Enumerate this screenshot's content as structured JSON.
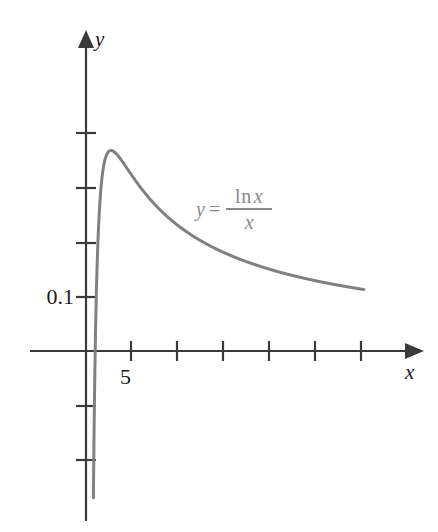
{
  "figure": {
    "title": "",
    "background_color": "#ffffff",
    "width": 438,
    "height": 532
  },
  "axes": {
    "x_axis_name": "x",
    "y_axis_name": "y",
    "axis_color": "#3a3a3a",
    "origin_px": {
      "x": 86,
      "y": 351
    },
    "x_tick_labels": [
      "5"
    ],
    "y_tick_labels": [
      "0.1"
    ]
  },
  "annotation": {
    "equation_lhs": "y",
    "equation_equals": "=",
    "equation_numerator_fn": "ln",
    "equation_numerator_var": "x",
    "equation_denominator": "x",
    "color": "#8a8a8a"
  },
  "chart_data": {
    "type": "line",
    "title": "",
    "xlabel": "x",
    "ylabel": "y",
    "series": [
      {
        "name": "y = ln x / x",
        "color": "#808080",
        "formula": "ln(x)/x",
        "x": [
          1.0,
          1.05,
          1.1,
          1.15,
          1.2,
          1.3,
          1.4,
          1.5,
          1.7,
          2.0,
          2.3,
          2.718,
          3.0,
          3.5,
          4.0,
          4.5,
          5.0,
          6.0,
          7.0,
          8.0,
          9.0,
          10.0,
          12.0,
          14.0,
          16.0,
          18.0,
          20.0,
          24.0,
          28.0,
          30.0,
          0.98,
          0.9,
          0.8,
          0.7,
          0.6,
          0.55,
          0.5
        ],
        "y": [
          0.0,
          0.0465,
          0.0866,
          0.1216,
          0.152,
          0.2018,
          0.2403,
          0.2703,
          0.3121,
          0.3466,
          0.3622,
          0.3679,
          0.3662,
          0.3579,
          0.3466,
          0.3342,
          0.3219,
          0.2986,
          0.278,
          0.2599,
          0.2441,
          0.2303,
          0.2071,
          0.1885,
          0.1733,
          0.1605,
          0.1498,
          0.1324,
          0.119,
          0.1134,
          -0.0206,
          -0.1171,
          -0.2789,
          -0.5095,
          -0.8514,
          -1.0873,
          -1.3863
        ]
      }
    ],
    "x_ticks": [
      5,
      10,
      15,
      20,
      25,
      30
    ],
    "x_tick_labels_shown": {
      "5": "5"
    },
    "y_ticks": [
      -0.2,
      -0.1,
      0.1,
      0.2,
      0.3,
      0.4
    ],
    "y_tick_labels_shown": {
      "0.1": "0.1"
    },
    "xlim": [
      -1.3,
      36.3
    ],
    "ylim": [
      -0.55,
      0.58
    ],
    "grid": false,
    "legend": "none",
    "annotations": [
      {
        "text": "y = ln x / x",
        "x": 13.0,
        "y": 0.3
      }
    ]
  }
}
